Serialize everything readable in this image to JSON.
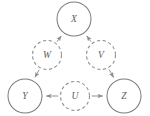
{
  "figure": {
    "kind": "causal-dag",
    "background_color": "#ffffff",
    "node_stroke_color": "#7d7d7d",
    "latent_stroke_color": "#8a8a8a",
    "edge_color": "#8d8d8d",
    "label_color": "#5c5c5c"
  },
  "nodes": [
    {
      "id": "X",
      "label": "X",
      "cx": 74,
      "cy": 19,
      "r": 17,
      "style": "solid",
      "observed": true
    },
    {
      "id": "W",
      "label": "W",
      "cx": 47,
      "cy": 55,
      "r": 14.5,
      "style": "dashed",
      "observed": false
    },
    {
      "id": "V",
      "label": "V",
      "cx": 101,
      "cy": 55,
      "r": 14.5,
      "style": "dashed",
      "observed": false
    },
    {
      "id": "Y",
      "label": "Y",
      "cx": 25,
      "cy": 96,
      "r": 17,
      "style": "solid",
      "observed": true
    },
    {
      "id": "U",
      "label": "U",
      "cx": 75,
      "cy": 96,
      "r": 14.5,
      "style": "dashed",
      "observed": false
    },
    {
      "id": "Z",
      "label": "Z",
      "cx": 124,
      "cy": 96,
      "r": 17,
      "style": "solid",
      "observed": true
    }
  ],
  "edges": [
    {
      "id": "W-X",
      "from": "W",
      "to": "X",
      "arrow": "to"
    },
    {
      "id": "V-X",
      "from": "V",
      "to": "X",
      "arrow": "to"
    },
    {
      "id": "W-Y",
      "from": "W",
      "to": "Y",
      "arrow": "to"
    },
    {
      "id": "V-Z",
      "from": "V",
      "to": "Z",
      "arrow": "to"
    },
    {
      "id": "U-Y",
      "from": "U",
      "to": "Y",
      "arrow": "to"
    },
    {
      "id": "U-Z",
      "from": "U",
      "to": "Z",
      "arrow": "to"
    }
  ]
}
